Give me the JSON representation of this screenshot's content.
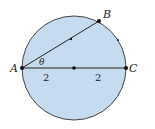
{
  "diagram": {
    "type": "circle-geometry",
    "colors": {
      "fill": "#c5dcf0",
      "stroke": "#333333"
    },
    "points": {
      "A": "A",
      "B": "B",
      "C": "C"
    },
    "angle_label": "θ",
    "segment_labels": [
      "2",
      "2"
    ]
  }
}
